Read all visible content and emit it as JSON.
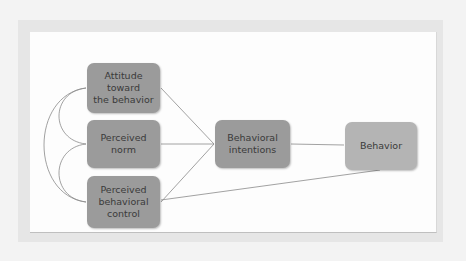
{
  "diagram": {
    "nodes": [
      {
        "id": "attitude",
        "label": "Attitude\ntoward\nthe behavior"
      },
      {
        "id": "norm",
        "label": "Perceived\nnorm"
      },
      {
        "id": "control",
        "label": "Perceived\nbehavioral\ncontrol"
      },
      {
        "id": "intentions",
        "label": "Behavioral\nintentions"
      },
      {
        "id": "behavior",
        "label": "Behavior"
      }
    ],
    "edges": [
      {
        "from": "attitude",
        "to": "intentions"
      },
      {
        "from": "norm",
        "to": "intentions"
      },
      {
        "from": "control",
        "to": "intentions"
      },
      {
        "from": "intentions",
        "to": "behavior"
      },
      {
        "from": "control",
        "to": "behavior"
      },
      {
        "from": "attitude",
        "to": "norm",
        "type": "correlation"
      },
      {
        "from": "norm",
        "to": "control",
        "type": "correlation"
      },
      {
        "from": "attitude",
        "to": "control",
        "type": "correlation"
      }
    ],
    "colors": {
      "node_dark": "#9b9b9b",
      "node_light": "#b4b4b4",
      "line": "#8a8a8a"
    }
  }
}
